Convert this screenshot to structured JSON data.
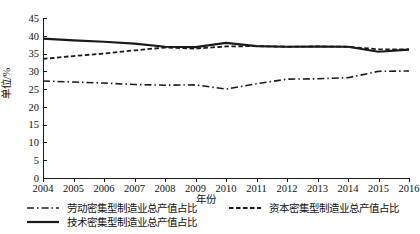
{
  "chart_data": {
    "type": "line",
    "title": "",
    "xlabel": "年份",
    "ylabel": "单位/%",
    "x": [
      2004,
      2005,
      2006,
      2007,
      2008,
      2009,
      2010,
      2011,
      2012,
      2013,
      2014,
      2015,
      2016
    ],
    "categories": [
      "2004",
      "2005",
      "2006",
      "2007",
      "2008",
      "2009",
      "2010",
      "2011",
      "2012",
      "2013",
      "2014",
      "2015",
      "2016"
    ],
    "ylim": [
      0,
      45
    ],
    "yticks": [
      0,
      5,
      10,
      15,
      20,
      25,
      30,
      35,
      40,
      45
    ],
    "ytick_labels": [
      "0",
      "5",
      "10",
      "15",
      "20",
      "25",
      "30",
      "35",
      "40",
      "45"
    ],
    "xlim": [
      2004,
      2016
    ],
    "grid": false,
    "legend_position": "below-axes",
    "series": [
      {
        "name": "劳动密集型制造业总产值占比",
        "style": "dash-dot",
        "color": "#1a1a1a",
        "values": [
          27.3,
          27.0,
          26.7,
          26.3,
          26.1,
          26.2,
          25.0,
          26.5,
          27.8,
          27.9,
          28.2,
          30.0,
          30.1
        ]
      },
      {
        "name": "资本密集型制造业总产值占比",
        "style": "dashed",
        "color": "#1a1a1a",
        "values": [
          33.5,
          34.3,
          35.0,
          35.9,
          36.7,
          36.4,
          37.0,
          37.1,
          36.9,
          37.0,
          36.9,
          36.2,
          36.2
        ]
      },
      {
        "name": "技术密集型制造业总产值占比",
        "style": "solid",
        "color": "#1a1a1a",
        "values": [
          39.2,
          38.7,
          38.3,
          37.8,
          36.9,
          36.8,
          38.0,
          37.1,
          36.9,
          37.0,
          36.9,
          35.5,
          36.1
        ]
      }
    ]
  },
  "legend": {
    "items": [
      {
        "label": "劳动密集型制造业总产值占比",
        "style": "dash-dot"
      },
      {
        "label": "资本密集型制造业总产值占比",
        "style": "dashed"
      },
      {
        "label": "技术密集型制造业总产值占比",
        "style": "solid"
      }
    ]
  }
}
